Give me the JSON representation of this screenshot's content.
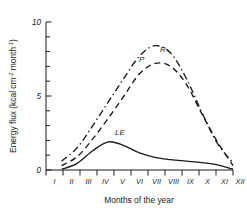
{
  "chart_data": {
    "type": "line",
    "title": "",
    "xlabel": "Months of the year",
    "ylabel": "Energy flux (kcal cm",
    "ylabel_sup1": "-2",
    "ylabel_mid": " month",
    "ylabel_sup2": "-1",
    "ylabel_end": ")",
    "ylabel_full": "Energy flux (kcal cm-2 month-1)",
    "xlim": [
      1,
      12
    ],
    "ylim": [
      0,
      10
    ],
    "yticks": [
      0,
      5,
      10
    ],
    "ytick_labels": [
      "0",
      "5",
      "10"
    ],
    "yminor_step": 1,
    "grid": false,
    "legend_position": "inline-annotations",
    "categories": [
      "I",
      "II",
      "III",
      "IV",
      "V",
      "VI",
      "VII",
      "VIII",
      "IX",
      "X",
      "XI",
      "XII"
    ],
    "series": [
      {
        "name": "R",
        "label": "R",
        "style": "dash-dot",
        "values": [
          0.6,
          1.5,
          3.0,
          4.6,
          6.2,
          7.7,
          8.4,
          7.9,
          6.2,
          3.9,
          1.8,
          0.5
        ]
      },
      {
        "name": "P",
        "label": "P",
        "style": "dashed",
        "values": [
          0.3,
          0.9,
          2.1,
          3.5,
          5.0,
          6.5,
          7.2,
          7.0,
          5.8,
          3.8,
          1.9,
          0.3
        ]
      },
      {
        "name": "LE",
        "label": "LE",
        "style": "solid",
        "values": [
          0.05,
          0.45,
          1.3,
          1.9,
          1.65,
          1.15,
          0.85,
          0.7,
          0.6,
          0.5,
          0.35,
          0.05
        ]
      }
    ],
    "annotations": [
      {
        "text": "R",
        "series": "R"
      },
      {
        "text": "P",
        "series": "P"
      },
      {
        "text": "LE",
        "series": "LE"
      }
    ]
  }
}
